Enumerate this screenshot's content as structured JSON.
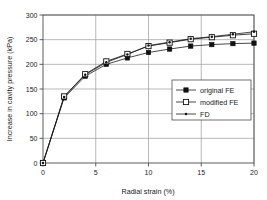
{
  "chart_data": {
    "type": "line",
    "title": "",
    "xlabel": "Radial strain (%)",
    "ylabel": "Increase in cavity pressure (kPa)",
    "xlim": [
      0,
      20
    ],
    "ylim": [
      0,
      300
    ],
    "xticks": [
      0,
      5,
      10,
      15,
      20
    ],
    "yticks": [
      0,
      50,
      100,
      150,
      200,
      250,
      300
    ],
    "xtick_labels": [
      "0",
      "5",
      "10",
      "15",
      "20"
    ],
    "ytick_labels": [
      "0",
      "50",
      "100",
      "150",
      "200",
      "250",
      "300"
    ],
    "grid": true,
    "legend_position": "lower right",
    "x": [
      0,
      2,
      4,
      6,
      8,
      10,
      12,
      14,
      16,
      18,
      20
    ],
    "series": [
      {
        "name": "original FE",
        "marker": "filled-square",
        "color": "#000000",
        "values": [
          0,
          132,
          176,
          200,
          213,
          224,
          231,
          237,
          240,
          242,
          243
        ]
      },
      {
        "name": "modified FE",
        "marker": "open-square",
        "color": "#000000",
        "values": [
          0,
          135,
          180,
          206,
          221,
          237,
          244,
          251,
          255,
          259,
          262
        ]
      },
      {
        "name": "FD",
        "marker": "small-dot",
        "color": "#000000",
        "values": [
          0,
          134,
          179,
          204,
          220,
          238,
          245,
          252,
          256,
          261,
          266
        ]
      }
    ]
  },
  "axes": {
    "x_title": "Radial strain (%)",
    "y_title": "Increase in cavity pressure (kPa)"
  },
  "legend": {
    "entries": [
      {
        "label": "original FE",
        "marker": "filled-square"
      },
      {
        "label": "modified FE",
        "marker": "open-square"
      },
      {
        "label": "FD",
        "marker": "small-dot"
      }
    ]
  },
  "colors": {
    "axis": "#4d4d4d",
    "grid": "#9a9a9a",
    "line": "#1a1a1a",
    "legend_border": "#4d4d4d",
    "background": "#ffffff"
  }
}
